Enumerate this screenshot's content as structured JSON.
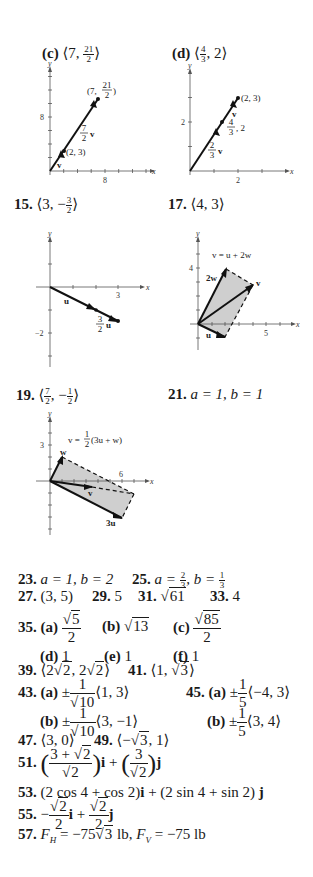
{
  "items": {
    "c": {
      "label": "(c)",
      "answer": "⟨7, 21/2⟩",
      "num": "21",
      "den": "2",
      "lead": "⟨7, ",
      "tail": "⟩"
    },
    "d": {
      "label": "(d)",
      "answer": "⟨4/3, 2⟩",
      "num": "4",
      "den": "3",
      "lead": "⟨",
      "tail": ", 2⟩"
    },
    "p15": {
      "label": "15.",
      "lead": "⟨3, −",
      "num": "3",
      "den": "2",
      "tail": "⟩"
    },
    "p17": {
      "label": "17.",
      "text": "⟨4, 3⟩"
    },
    "p19": {
      "label": "19.",
      "lead": "⟨",
      "num1": "7",
      "den1": "2",
      "mid": ", −",
      "num2": "1",
      "den2": "2",
      "tail": "⟩"
    },
    "p21": {
      "label": "21.",
      "text": "a = 1, b = 1"
    },
    "p23": {
      "label": "23.",
      "text": "a = 1, b = 2"
    },
    "p25": {
      "label": "25.",
      "a": "a = ",
      "an": "2",
      "ad": "3",
      "b": ", b = ",
      "bn": "1",
      "bd": "3"
    },
    "p27": {
      "label": "27.",
      "text": "(3, 5)"
    },
    "p29": {
      "label": "29.",
      "text": "5"
    },
    "p31": {
      "label": "31.",
      "radicand": "61"
    },
    "p33": {
      "label": "33.",
      "text": "4"
    },
    "p35": {
      "label": "35.",
      "a": {
        "label": "(a)",
        "radicand": "5",
        "den": "2"
      },
      "b": {
        "label": "(b)",
        "radicand": "13"
      },
      "c": {
        "label": "(c)",
        "radicand": "85",
        "den": "2"
      },
      "d": {
        "label": "(d)",
        "text": "1"
      },
      "e": {
        "label": "(e)",
        "text": "1"
      },
      "f": {
        "label": "(f)",
        "text": "1"
      }
    },
    "p39": {
      "label": "39.",
      "lead": "⟨2",
      "r1": "2",
      "mid": ", 2",
      "r2": "2",
      "tail": "⟩"
    },
    "p41": {
      "label": "41.",
      "lead": "⟨1, ",
      "r": "3",
      "tail": "⟩"
    },
    "p43": {
      "label": "43.",
      "a": {
        "label": "(a)",
        "pm": "±",
        "num": "1",
        "rad": "10",
        "vec": "⟨1, 3⟩"
      },
      "b": {
        "label": "(b)",
        "pm": "±",
        "num": "1",
        "rad": "10",
        "vec": "⟨3, −1⟩"
      }
    },
    "p45": {
      "label": "45.",
      "a": {
        "label": "(a)",
        "pm": "±",
        "num": "1",
        "den": "5",
        "vec": "⟨−4, 3⟩"
      },
      "b": {
        "label": "(b)",
        "pm": "±",
        "num": "1",
        "den": "5",
        "vec": "⟨3, 4⟩"
      }
    },
    "p47": {
      "label": "47.",
      "text": "⟨3, 0⟩"
    },
    "p49": {
      "label": "49.",
      "lead": "⟨−",
      "r": "3",
      "tail": ", 1⟩"
    },
    "p51": {
      "label": "51.",
      "n1": "3 + ",
      "r1": "2",
      "d1": "2",
      "i": "i",
      "plus": " + ",
      "n2": "3",
      "d2": "2",
      "j": "j"
    },
    "p53": {
      "label": "53.",
      "t1": "(2 cos 4 + cos 2)",
      "i": "i",
      "t2": " + (2 sin 4 + sin 2) ",
      "j": "j"
    },
    "p55": {
      "label": "55.",
      "minus": "−",
      "r": "2",
      "den": "2",
      "i": "i",
      "plus": " + ",
      "j": "j"
    },
    "p57": {
      "label": "57.",
      "fh": "F",
      "h": "H",
      "eq1": " = −75",
      "r": "3",
      "lb1": " lb, ",
      "fv": "F",
      "v": "V",
      "eq2": " = −75 lb"
    }
  },
  "graphs": {
    "c": {
      "tick_x": "8",
      "tick_y": "8",
      "axis_x": "x",
      "axis_y": "y",
      "point_label": "(2, 3)",
      "end_num": "21",
      "end_den": "2",
      "end_lead": "(7, ",
      "end_tail": ")",
      "vec_label": "v",
      "scaled_num": "7",
      "scaled_den": "2",
      "scaled_vec": "v"
    },
    "d": {
      "tick_x": "2",
      "tick_y": "2",
      "axis_x": "x",
      "axis_y": "y",
      "point_label": "(2, 3)",
      "mid_num": "4",
      "mid_den": "3",
      "mid_tail": ", 2",
      "vec_label": "v",
      "scaled_num": "2",
      "scaled_den": "3",
      "scaled_vec": "v"
    },
    "g15": {
      "tick_x": "3",
      "tick_y": "−2",
      "axis_x": "x",
      "axis_y": "y",
      "vec_label": "u",
      "scaled_num": "3",
      "scaled_den": "2",
      "scaled_vec": "u"
    },
    "g17": {
      "tick_x": "5",
      "tick_y": "4",
      "axis_x": "x",
      "axis_y": "y",
      "equation": "v = u + 2w",
      "label_2w": "2w",
      "label_v": "v",
      "label_u": "u"
    },
    "g19": {
      "tick_x": "6",
      "tick_y": "3",
      "axis_x": "x",
      "axis_y": "y",
      "eq_lead": "v = ",
      "eq_num": "1",
      "eq_den": "2",
      "eq_tail": "(3u + w)",
      "label_w": "w",
      "label_v": "v",
      "label_3u": "3u"
    }
  }
}
